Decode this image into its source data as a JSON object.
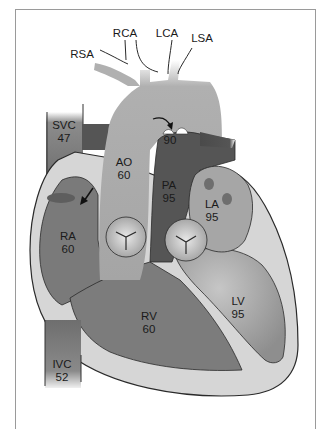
{
  "diagram": {
    "type": "heart-cross-section",
    "labels": {
      "rca": "RCA",
      "lca": "LCA",
      "lsa": "LSA",
      "rsa": "RSA",
      "svc": {
        "name": "SVC",
        "value": "47"
      },
      "ivc": {
        "name": "IVC",
        "value": "52"
      },
      "ao": {
        "name": "AO",
        "value": "60"
      },
      "pa": {
        "name": "PA",
        "value": "95"
      },
      "la": {
        "name": "LA",
        "value": "95"
      },
      "ra": {
        "name": "RA",
        "value": "60"
      },
      "rv": {
        "name": "RV",
        "value": "60"
      },
      "lv": {
        "name": "LV",
        "value": "95"
      },
      "ductus": {
        "value": "90"
      }
    },
    "colors": {
      "aorta": "#a9a9a9",
      "pulmonary": "#555555",
      "right_heart": "#787878",
      "left_heart": "#9e9e9e",
      "wall": "#d4d4d4",
      "outline": "#2a2a2a"
    }
  }
}
